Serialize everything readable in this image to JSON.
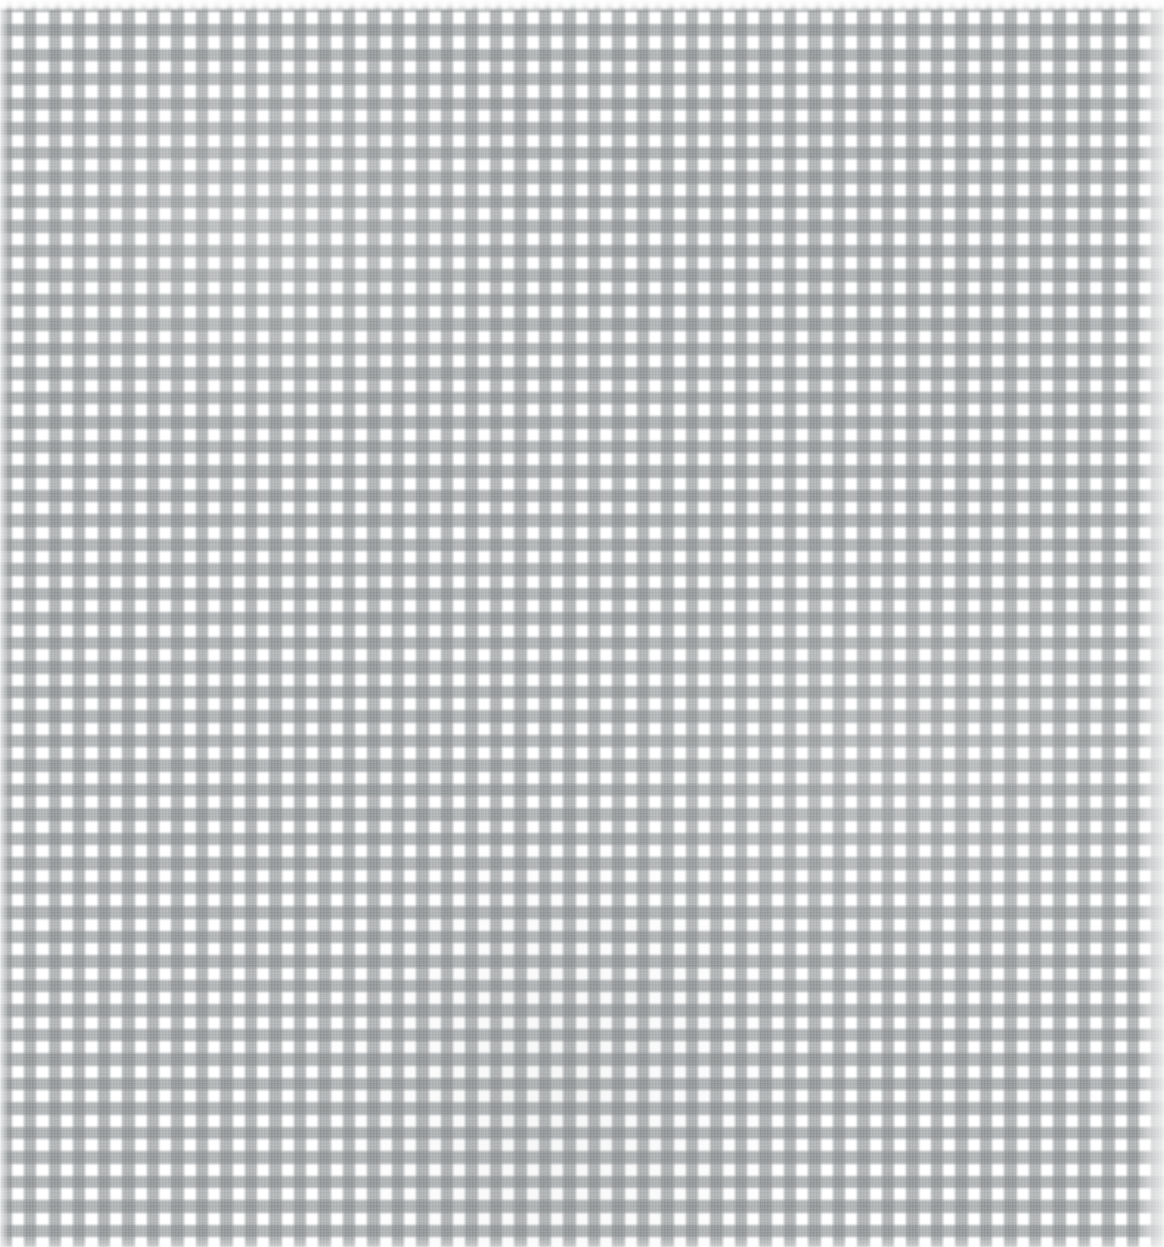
{
  "image": {
    "title": "Grey and white gingham fabric texture",
    "kind": "textile-swatch",
    "width": 1164,
    "height": 1247
  },
  "pattern": {
    "name": "gingham-check",
    "weave": "plain-weave",
    "repeat_px": 24.5,
    "band_px": 12,
    "gap_px": 12.5,
    "orientation": "orthogonal",
    "thread_striation_px": 3.1
  },
  "colors": {
    "white_square": "#ffffff",
    "light_square": "#f4f5f5",
    "mid_grey_band": "#9fa3a5",
    "dark_intersection": "#8a8e90",
    "thread_highlight": "#ffffff",
    "thread_shadow": "#5a5e60",
    "background": "#ffffff"
  },
  "edges": {
    "top": {
      "name": "top-selvedge",
      "style": "washed-white-scallop",
      "height_px": 11
    },
    "left": {
      "name": "left-selvedge",
      "style": "light-fade",
      "width_px": 9
    },
    "right": {
      "name": "right-selvedge",
      "style": "washed-fade",
      "width_px": 26
    },
    "bottom": {
      "name": "bottom-edge",
      "style": "soft-fade",
      "height_px": 8
    }
  },
  "layers": [
    {
      "name": "warp-stripes",
      "label": "Vertical grey bands"
    },
    {
      "name": "weft-stripes",
      "label": "Horizontal grey bands"
    },
    {
      "name": "thread-texture",
      "label": "Woven thread striations"
    },
    {
      "name": "cloth-mottling",
      "label": "Irregular cloth shading"
    }
  ]
}
